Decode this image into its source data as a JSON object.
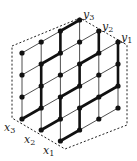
{
  "diagram": {
    "colors": {
      "line": "#222222",
      "path": "#111111",
      "dash": "#222222",
      "background": "#ffffff"
    },
    "start_labels": [
      {
        "letter": "x",
        "sub": "1"
      },
      {
        "letter": "x",
        "sub": "2"
      },
      {
        "letter": "x",
        "sub": "3"
      }
    ],
    "end_labels": [
      {
        "letter": "y",
        "sub": "1"
      },
      {
        "letter": "y",
        "sub": "2"
      },
      {
        "letter": "y",
        "sub": "3"
      }
    ],
    "paths": [
      {
        "from": "x1",
        "to": "y1"
      },
      {
        "from": "x2",
        "to": "y2"
      },
      {
        "from": "x3",
        "to": "y3"
      }
    ]
  }
}
